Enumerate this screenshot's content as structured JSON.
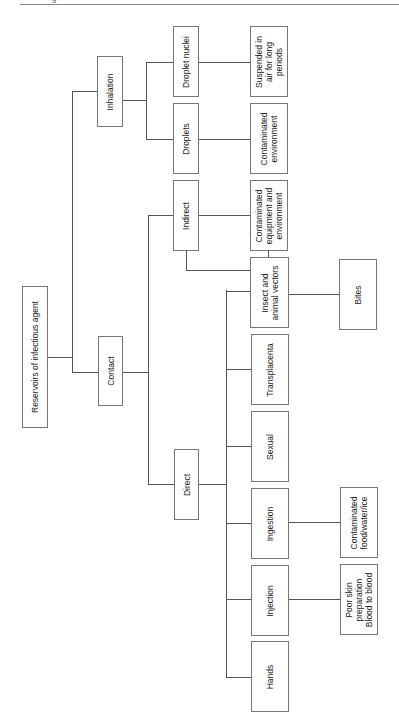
{
  "header": {
    "mark": "g"
  },
  "diagram": {
    "root": "Reservoirs of infectious agent",
    "routes": {
      "contact": "Contact",
      "inhalation": "Inhalation"
    },
    "contact_types": {
      "direct": "Direct",
      "indirect": "Indirect"
    },
    "inhalation_types": {
      "droplet_nuclei": "Droplet nuclei",
      "droplets": "Droplets"
    },
    "direct_modes": {
      "insect_vectors": "Insect and\nanimal vectors",
      "transplacenta": "Transplacenta",
      "sexual": "Sexual",
      "ingestion": "Ingestion",
      "injection": "Injection",
      "hands": "Hands"
    },
    "outcomes": {
      "suspended": "Suspended in\nair for long\nperiods",
      "contaminated_environment": "Contaminated\nenvironment",
      "contaminated_equipment": "Contaminated\nequipment and\nenvironment",
      "bites": "Bites",
      "contaminated_food": "Contaminated\nfood/water/ice",
      "poor_skin": "Poor skin\npreparation\nBlood to blood"
    }
  }
}
